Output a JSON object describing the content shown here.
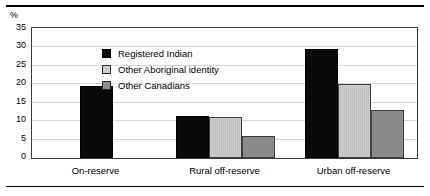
{
  "chart_data": {
    "type": "bar",
    "title": "",
    "xlabel": "",
    "ylabel": "%",
    "ylim": [
      0,
      35
    ],
    "yticks": [
      0,
      5,
      10,
      15,
      20,
      25,
      30,
      35
    ],
    "grid": true,
    "legend_position": "inside-upper-left",
    "categories": [
      "On-reserve",
      "Rural off-reserve",
      "Urban off-reserve"
    ],
    "series": [
      {
        "name": "Registered Indian",
        "color": "#0a0a0a",
        "values": [
          19.5,
          11.5,
          29.5
        ]
      },
      {
        "name": "Other Aboriginal identity",
        "color": "#cdcdcd",
        "values": [
          null,
          11.0,
          20.0
        ]
      },
      {
        "name": "Other Canadians",
        "color": "#8d8d8d",
        "values": [
          null,
          6.0,
          13.0
        ]
      }
    ]
  },
  "axis": {
    "unit": "%"
  },
  "colors": {
    "frame": "#3a3a3a",
    "gridline": "#d8d8d8",
    "rule": "#000000"
  }
}
